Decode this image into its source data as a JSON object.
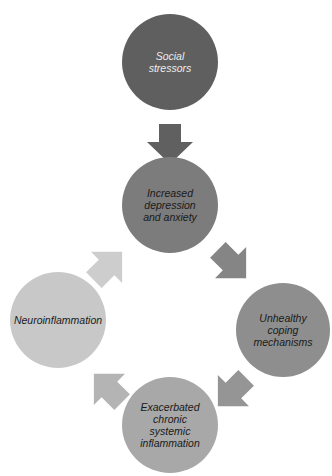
{
  "diagram": {
    "type": "cycle",
    "nodes": [
      {
        "id": "social-stressors",
        "lines": [
          "Social",
          "stressors"
        ],
        "color": "#5f5f5f",
        "text_color": "#ececec",
        "cx": 170,
        "cy": 62,
        "r": 48
      },
      {
        "id": "depression-anxiety",
        "lines": [
          "Increased",
          "depression",
          "and anxiety"
        ],
        "color": "#7c7c7c",
        "text_color": "#1a1a1a",
        "cx": 170,
        "cy": 205,
        "r": 48
      },
      {
        "id": "unhealthy-coping",
        "lines": [
          "Unhealthy",
          "coping",
          "mechanisms"
        ],
        "color": "#8e8e8e",
        "text_color": "#1a1a1a",
        "cx": 283,
        "cy": 330,
        "r": 47
      },
      {
        "id": "systemic-inflammation",
        "lines": [
          "Exacerbated",
          "chronic",
          "systemic",
          "inflammation"
        ],
        "color": "#a8a8a8",
        "text_color": "#1a1a1a",
        "cx": 170,
        "cy": 425,
        "r": 48
      },
      {
        "id": "neuroinflammation",
        "lines": [
          "Neuroinflammation"
        ],
        "color": "#c8c8c8",
        "text_color": "#1a1a1a",
        "cx": 58,
        "cy": 320,
        "r": 48
      }
    ],
    "edges": [
      {
        "from": "social-stressors",
        "to": "depression-anxiety",
        "color": "#606060"
      },
      {
        "from": "depression-anxiety",
        "to": "unhealthy-coping",
        "color": "#858585"
      },
      {
        "from": "unhealthy-coping",
        "to": "systemic-inflammation",
        "color": "#959595"
      },
      {
        "from": "systemic-inflammation",
        "to": "neuroinflammation",
        "color": "#b4b4b4"
      },
      {
        "from": "neuroinflammation",
        "to": "depression-anxiety",
        "color": "#cdcdcd"
      }
    ]
  }
}
